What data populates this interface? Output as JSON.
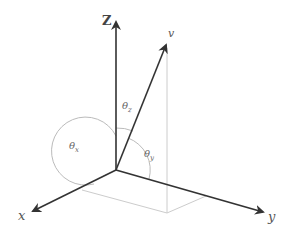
{
  "diagram": {
    "type": "3d-coordinate-vector-angles",
    "axes": {
      "z": {
        "label": "Z"
      },
      "x": {
        "label": "x"
      },
      "y": {
        "label": "y"
      }
    },
    "vector": {
      "label": "v"
    },
    "angles": [
      {
        "symbol": "θ",
        "sub": "z"
      },
      {
        "symbol": "θ",
        "sub": "x"
      },
      {
        "symbol": "θ",
        "sub": "y"
      }
    ],
    "colors": {
      "axis": "#333333",
      "projection": "#cccccc",
      "arc": "#bbbbbb",
      "label": "#555555"
    }
  }
}
